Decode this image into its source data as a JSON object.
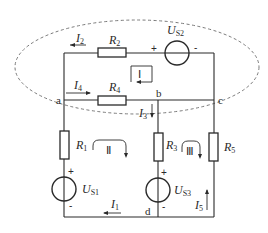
{
  "diagram": {
    "type": "circuit",
    "nodes": {
      "a": "a",
      "b": "b",
      "c": "c",
      "d": "d"
    },
    "resistors": {
      "R1": {
        "name": "R",
        "sub": "1"
      },
      "R2": {
        "name": "R",
        "sub": "2"
      },
      "R3": {
        "name": "R",
        "sub": "3"
      },
      "R4": {
        "name": "R",
        "sub": "4"
      },
      "R5": {
        "name": "R",
        "sub": "5"
      }
    },
    "sources": {
      "US1": {
        "name": "U",
        "sub": "S1",
        "plus": "+",
        "minus": "-"
      },
      "US2": {
        "name": "U",
        "sub": "S2",
        "plus": "+",
        "minus": "-"
      },
      "US3": {
        "name": "U",
        "sub": "S3",
        "plus": "+",
        "minus": "-"
      }
    },
    "currents": {
      "I1": {
        "name": "I",
        "sub": "1"
      },
      "I2": {
        "name": "I",
        "sub": "2"
      },
      "I3": {
        "name": "I",
        "sub": "3"
      },
      "I4": {
        "name": "I",
        "sub": "4"
      },
      "I5": {
        "name": "I",
        "sub": "5"
      }
    },
    "loops": {
      "L1": "Ⅰ",
      "L2": "Ⅱ",
      "L3": "Ⅲ"
    },
    "colors": {
      "line": "#2a2a2a",
      "dashed_boundary": "#7a7a7a",
      "background": "#ffffff"
    }
  }
}
